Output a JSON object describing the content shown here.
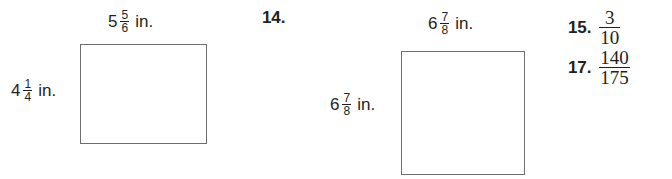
{
  "page": {
    "background_color": "#ffffff",
    "text_color": "#231f20",
    "shape_border_color": "#6d6e71"
  },
  "figures": [
    {
      "id": "rectangle-figure",
      "shape": "rectangle",
      "top_label": {
        "whole": "5",
        "numerator": "5",
        "denominator": "6",
        "unit": "in."
      },
      "left_label": {
        "whole": "4",
        "numerator": "1",
        "denominator": "4",
        "unit": "in."
      }
    },
    {
      "id": "square-figure",
      "shape": "square",
      "top_label": {
        "whole": "6",
        "numerator": "7",
        "denominator": "8",
        "unit": "in."
      },
      "left_label": {
        "whole": "6",
        "numerator": "7",
        "denominator": "8",
        "unit": "in."
      }
    }
  ],
  "exercise_number": {
    "label": "14."
  },
  "answers": [
    {
      "number": "15.",
      "numerator": "3",
      "denominator": "10"
    },
    {
      "number": "17.",
      "numerator": "140",
      "denominator": "175"
    }
  ]
}
